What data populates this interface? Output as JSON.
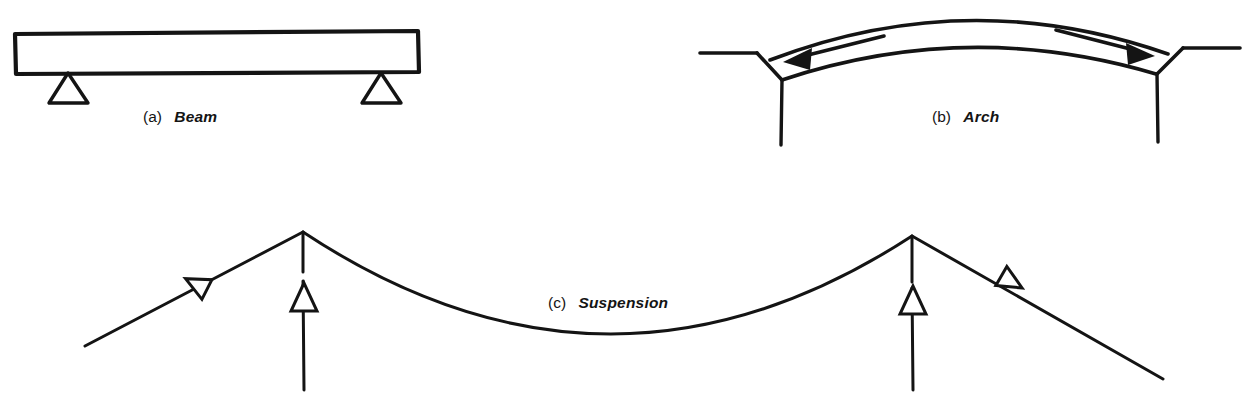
{
  "figure": {
    "ink_color": "#141414",
    "background_color": "#ffffff",
    "panels": [
      {
        "id": "beam",
        "tag": "(a)",
        "label": "Beam",
        "caption_x": 143,
        "caption_y": 122,
        "description": "Horizontal rectangular beam resting on two triangular supports"
      },
      {
        "id": "arch",
        "tag": "(b)",
        "label": "Arch",
        "caption_x": 932,
        "caption_y": 122,
        "description": "Curved arch band springing from two wedge abutments with outward thrust arrows"
      },
      {
        "id": "suspension",
        "tag": "(c)",
        "label": "Suspension",
        "caption_x": 548,
        "caption_y": 308,
        "description": "Catenary main cable over two towers with anchored backstays, cable tension arrows and upward tower reaction arrows"
      }
    ],
    "beam": {
      "deck": {
        "x": 14,
        "y": 33,
        "width": 405,
        "height": 40
      },
      "supports": [
        {
          "name": "left-support",
          "apex_x": 68,
          "apex_y": 73,
          "base_y": 103,
          "half_width": 19
        },
        {
          "name": "right-support",
          "apex_x": 381,
          "apex_y": 73,
          "base_y": 103,
          "half_width": 19
        }
      ]
    },
    "arch": {
      "extrados": "M 778 72 Q 968 -14 1160 66",
      "intrados": "M 782 78 Q 968 16 1156 72",
      "abutments": [
        {
          "name": "left-abutment",
          "ground_line": [
            700,
            53,
            755,
            53
          ],
          "wedge": [
            755,
            53,
            781,
            79
          ],
          "pier": [
            781,
            79,
            781,
            143
          ]
        },
        {
          "name": "right-abutment",
          "ground_line": [
            1182,
            48,
            1240,
            48
          ],
          "wedge": [
            1182,
            48,
            1157,
            73
          ],
          "pier": [
            1157,
            73,
            1157,
            140
          ]
        }
      ],
      "thrust_arrows": [
        {
          "name": "left-thrust-arrow",
          "direction": "left",
          "tail": [
            880,
            38
          ],
          "head": [
            786,
            62
          ]
        },
        {
          "name": "right-thrust-arrow",
          "direction": "right",
          "tail": [
            1060,
            32
          ],
          "head": [
            1152,
            56
          ]
        }
      ]
    },
    "suspension": {
      "towers": [
        {
          "name": "left-tower",
          "peak_x": 303,
          "peak_y": 232,
          "base_y": 390,
          "arrow_y": 295
        },
        {
          "name": "right-tower",
          "peak_x": 912,
          "peak_y": 236,
          "base_y": 390,
          "arrow_y": 298
        }
      ],
      "main_span": "M 303 232 Q 607 430 912 236",
      "backstays": [
        {
          "name": "left-backstay",
          "from": [
            303,
            232
          ],
          "to": [
            85,
            345
          ]
        },
        {
          "name": "right-backstay",
          "from": [
            912,
            236
          ],
          "to": [
            1162,
            378
          ]
        }
      ],
      "tension_arrows": [
        {
          "name": "left-cable-tension-arrow",
          "x": 198,
          "y": 285,
          "angle": 207
        },
        {
          "name": "right-cable-tension-arrow",
          "x": 1010,
          "y": 280,
          "angle": 30
        }
      ]
    }
  }
}
